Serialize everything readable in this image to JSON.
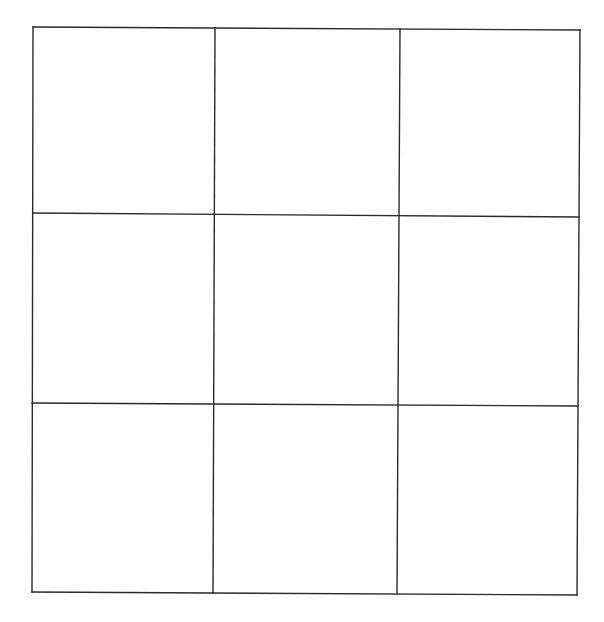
{
  "diagram": {
    "type": "grid",
    "rows": 3,
    "columns": 3,
    "line_color": "#2b2b2b",
    "background": "#ffffff",
    "corners": {
      "top_left": [
        33,
        27
      ],
      "top_right": [
        580,
        30
      ],
      "bottom_left": [
        32,
        592
      ],
      "bottom_right": [
        577,
        595
      ]
    },
    "vertical_lines": [
      {
        "x1": 33,
        "y1": 27,
        "x2": 32,
        "y2": 592
      },
      {
        "x1": 215,
        "y1": 28,
        "x2": 213,
        "y2": 593
      },
      {
        "x1": 400,
        "y1": 29,
        "x2": 397,
        "y2": 594
      },
      {
        "x1": 580,
        "y1": 30,
        "x2": 577,
        "y2": 595
      }
    ],
    "horizontal_lines": [
      {
        "x1": 33,
        "y1": 27,
        "x2": 580,
        "y2": 30
      },
      {
        "x1": 33,
        "y1": 213,
        "x2": 579,
        "y2": 217
      },
      {
        "x1": 32,
        "y1": 403,
        "x2": 578,
        "y2": 406
      },
      {
        "x1": 32,
        "y1": 592,
        "x2": 577,
        "y2": 595
      }
    ],
    "cells": [
      {
        "row": 0,
        "col": 0,
        "value": ""
      },
      {
        "row": 0,
        "col": 1,
        "value": ""
      },
      {
        "row": 0,
        "col": 2,
        "value": ""
      },
      {
        "row": 1,
        "col": 0,
        "value": ""
      },
      {
        "row": 1,
        "col": 1,
        "value": ""
      },
      {
        "row": 1,
        "col": 2,
        "value": ""
      },
      {
        "row": 2,
        "col": 0,
        "value": ""
      },
      {
        "row": 2,
        "col": 1,
        "value": ""
      },
      {
        "row": 2,
        "col": 2,
        "value": ""
      }
    ]
  }
}
